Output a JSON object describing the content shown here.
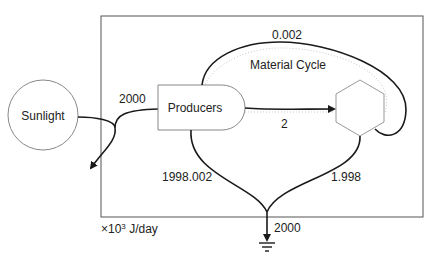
{
  "diagram": {
    "nodes": {
      "sunlight": {
        "label": "Sunlight",
        "shape": "circle"
      },
      "producers": {
        "label": "Producers",
        "shape": "rounded-tank"
      },
      "consumers": {
        "label": "",
        "shape": "hexagon"
      },
      "heat_sink": {
        "label": "",
        "shape": "ground-symbol"
      }
    },
    "labels": {
      "material_cycle": "Material Cycle",
      "units_prefix": "×10",
      "units_exp": "3",
      "units_suffix": " J/day"
    },
    "flows": [
      {
        "id": "sunlight_to_producers",
        "value": "2000"
      },
      {
        "id": "recycle_to_producers",
        "value": "0.002"
      },
      {
        "id": "producers_to_consumers",
        "value": "2"
      },
      {
        "id": "producers_to_sink",
        "value": "1998.002"
      },
      {
        "id": "consumers_to_sink",
        "value": "1.998"
      },
      {
        "id": "total_to_sink",
        "value": "2000"
      }
    ],
    "colors": {
      "line": "#1a1a1a",
      "frame": "#555555",
      "node_border": "#888888",
      "dotted": "#bbbbbb"
    }
  }
}
